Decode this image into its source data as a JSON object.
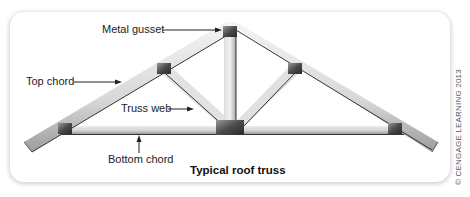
{
  "figure": {
    "title": "Typical roof truss",
    "copyright": "© CENGAGE LEARNING 2013",
    "labels": {
      "metal_gusset": "Metal gusset",
      "top_chord": "Top chord",
      "truss_web": "Truss web",
      "bottom_chord": "Bottom chord"
    }
  },
  "colors": {
    "member_light": "#e8e8e8",
    "member_shade": "#9a9a9a",
    "member_edge": "#333333",
    "gusset_dark": "#3a3a3a",
    "gusset_light": "#8a8a8a",
    "frame_shadow": "#d0d0d0"
  }
}
